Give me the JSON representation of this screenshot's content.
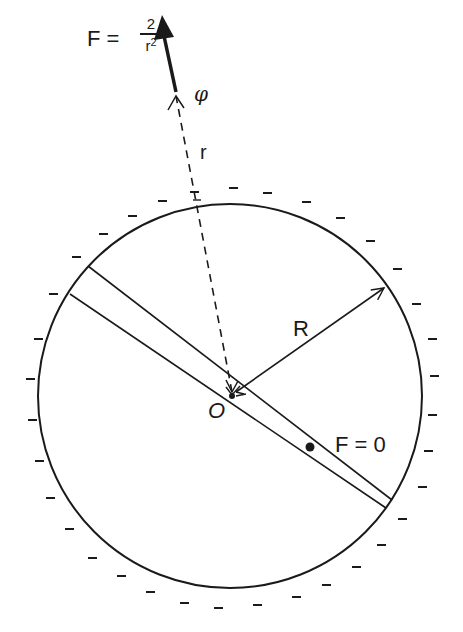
{
  "diagram": {
    "force_label": {
      "lhs": "F =",
      "numerator": "2",
      "denominator_base": "r",
      "denominator_exp": "2"
    },
    "phi_label": "φ",
    "r_label": "r",
    "R_label": "R",
    "origin_label": "O",
    "zero_force_label": "F = 0",
    "colors": {
      "ink": "#1a1a1a",
      "background": "#ffffff"
    },
    "geometry": {
      "circle_center": [
        230,
        396
      ],
      "circle_radius": 192,
      "charge_sign": "−"
    }
  }
}
